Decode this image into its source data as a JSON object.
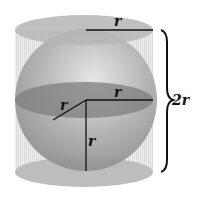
{
  "diagram": {
    "labels": {
      "top_radius": "r",
      "equator_radius": "r",
      "diagonal_radius": "r",
      "vertical_radius": "r",
      "height": "2r"
    },
    "colors": {
      "cylinder_cap": "#b8b8b8",
      "cylinder_side": "#e2e2e2",
      "sphere": "#a9a9a9",
      "equator": "#7a7a7a",
      "lines": "#111111"
    }
  }
}
